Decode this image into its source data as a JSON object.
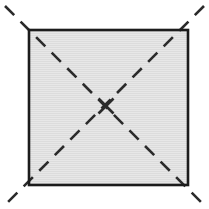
{
  "figure": {
    "canvas": {
      "width": 209,
      "height": 209,
      "background_color": "#ffffff"
    }
  },
  "shapes": {
    "square": {
      "name": "gray-square",
      "x": 29,
      "y": 30,
      "width": 159,
      "height": 155,
      "fill_color": "#dcdcdc",
      "stroke_color": "#1c1c1c",
      "stroke_width": 2.6
    },
    "diagonals": [
      {
        "name": "diagonal-tl-br",
        "x1": 5,
        "y1": 6,
        "x2": 204,
        "y2": 205,
        "stroke_color": "#2b2b2b",
        "stroke_width": 2.6,
        "dash_pattern": "13 9"
      },
      {
        "name": "diagonal-tr-bl",
        "x1": 204,
        "y1": 6,
        "x2": 5,
        "y2": 205,
        "stroke_color": "#2b2b2b",
        "stroke_width": 2.6,
        "dash_pattern": "13 9"
      }
    ],
    "center_marker": {
      "name": "center-cross",
      "cx": 106,
      "cy": 106,
      "size": 15,
      "stroke_color": "#2b2b2b",
      "stroke_width": 2.6
    }
  },
  "texture": {
    "name": "horizontal-scanlines",
    "color": "#ffffff",
    "opacity": 0.28,
    "spacing": 2
  }
}
